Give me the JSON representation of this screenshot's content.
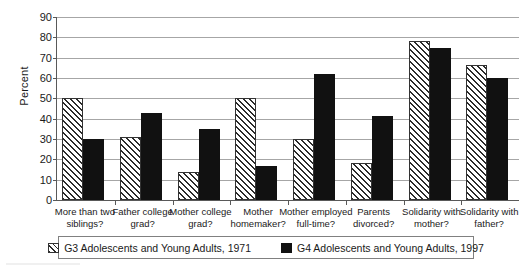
{
  "chart_data": {
    "type": "bar",
    "title": "",
    "xlabel": "",
    "ylabel": "Percent",
    "ylim": [
      0,
      90
    ],
    "ytick_step": 10,
    "yticks": [
      0,
      10,
      20,
      30,
      40,
      50,
      60,
      70,
      80,
      90
    ],
    "grid": true,
    "legend_position": "bottom",
    "categories": [
      "More than two siblings?",
      "Father college grad?",
      "Mother college grad?",
      "Mother homemaker?",
      "Mother employed full-time?",
      "Parents divorced?",
      "Solidarity with mother?",
      "Solidarity with father?"
    ],
    "category_lines": [
      [
        "More than two",
        "siblings?"
      ],
      [
        "Father college",
        "grad?"
      ],
      [
        "Mother college",
        "grad?"
      ],
      [
        "Mother",
        "homemaker?"
      ],
      [
        "Mother employed",
        "full-time?"
      ],
      [
        "Parents",
        "divorced?"
      ],
      [
        "Solidarity with",
        "mother?"
      ],
      [
        "Solidarity with",
        "father?"
      ]
    ],
    "series": [
      {
        "name": "G3 Adolescents and Young Adults, 1971",
        "pattern": "diagonal-hatch",
        "color": "#ffffff",
        "values": [
          50,
          31,
          14,
          50,
          30,
          18,
          78,
          66.5
        ]
      },
      {
        "name": "G4 Adolescents and Young Adults, 1997",
        "pattern": "solid",
        "color": "#111111",
        "values": [
          30,
          43,
          35,
          16.5,
          62,
          41.5,
          75,
          60
        ]
      }
    ]
  },
  "legend": {
    "items": [
      {
        "label": "G3 Adolescents and Young Adults, 1971",
        "swatch": "hatch-swatch"
      },
      {
        "label": "G4 Adolescents and Young Adults, 1997",
        "swatch": "solid-swatch"
      }
    ]
  }
}
